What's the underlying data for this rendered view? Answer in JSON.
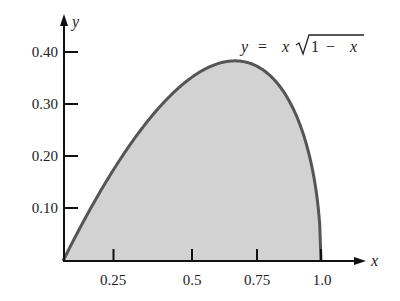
{
  "chart_data": {
    "type": "area",
    "title": "",
    "annotation": "y = x √(1 − x)",
    "function": "y = x*sqrt(1-x)",
    "xlabel": "x",
    "ylabel": "y",
    "xlim": [
      0,
      1.15
    ],
    "ylim": [
      0,
      0.47
    ],
    "x_ticks": [
      0.25,
      0.5,
      0.75,
      1.0
    ],
    "x_tick_labels": [
      "0.25",
      "0.5",
      "0.75",
      "1.0"
    ],
    "y_ticks": [
      0.1,
      0.2,
      0.3,
      0.4
    ],
    "y_tick_labels": [
      "0.10",
      "0.20",
      "0.30",
      "0.40"
    ],
    "grid": false,
    "shaded_region": {
      "from": 0,
      "to": 1.0
    },
    "x": [
      0,
      0.1,
      0.2,
      0.3,
      0.4,
      0.5,
      0.6,
      0.6667,
      0.7,
      0.8,
      0.9,
      0.95,
      1.0
    ],
    "values": [
      0,
      0.0949,
      0.1789,
      0.251,
      0.3098,
      0.3536,
      0.3795,
      0.3849,
      0.3834,
      0.3578,
      0.2846,
      0.2124,
      0
    ],
    "colors": {
      "fill": "#d2d2d2",
      "curve": "#555555",
      "axis": "#111111"
    }
  },
  "labels": {
    "x_axis": "x",
    "y_axis": "y",
    "equation_y": "y",
    "equation_eq": "=",
    "equation_x": "x",
    "equation_one": "1",
    "equation_minus": "−",
    "equation_x2": "x",
    "x_ticks": [
      "0.25",
      "0.5",
      "0.75",
      "1.0"
    ],
    "y_ticks": [
      "0.10",
      "0.20",
      "0.30",
      "0.40"
    ]
  }
}
